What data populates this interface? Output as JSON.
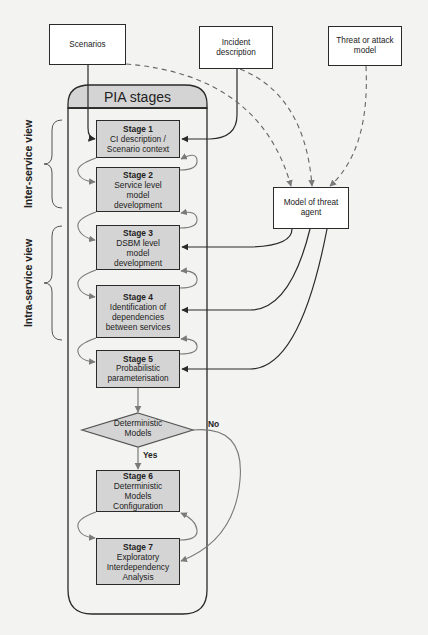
{
  "inputs": {
    "scenarios": "Scenarios",
    "incident_description": "Incident description",
    "threat_model": "Threat or attack model"
  },
  "threat_agent": {
    "label": "Model of threat agent"
  },
  "pia": {
    "title": "PIA stages",
    "stages": [
      {
        "num": "Stage 1",
        "label": "CI description / Scenario context"
      },
      {
        "num": "Stage 2",
        "label": "Service level model development"
      },
      {
        "num": "Stage 3",
        "label": "DSBM level model development"
      },
      {
        "num": "Stage 4",
        "label": "Identification of dependencies between services"
      },
      {
        "num": "Stage 5",
        "label": "Probabilistic parameterisation"
      },
      {
        "num": "Stage 6",
        "label": "Deterministic Models Configuration"
      },
      {
        "num": "Stage 7",
        "label": "Exploratory Interdependency Analysis"
      }
    ],
    "decision": {
      "label": "Deterministic Models",
      "yes": "Yes",
      "no": "No"
    }
  },
  "views": {
    "inter_service": "Inter-service view",
    "intra_service": "Intra-service view"
  },
  "colors": {
    "stage_fill": "#d4d4d4",
    "line": "#2a2a2a",
    "loop_arrow": "#7a7a7a",
    "background": "#f3f3f1"
  }
}
